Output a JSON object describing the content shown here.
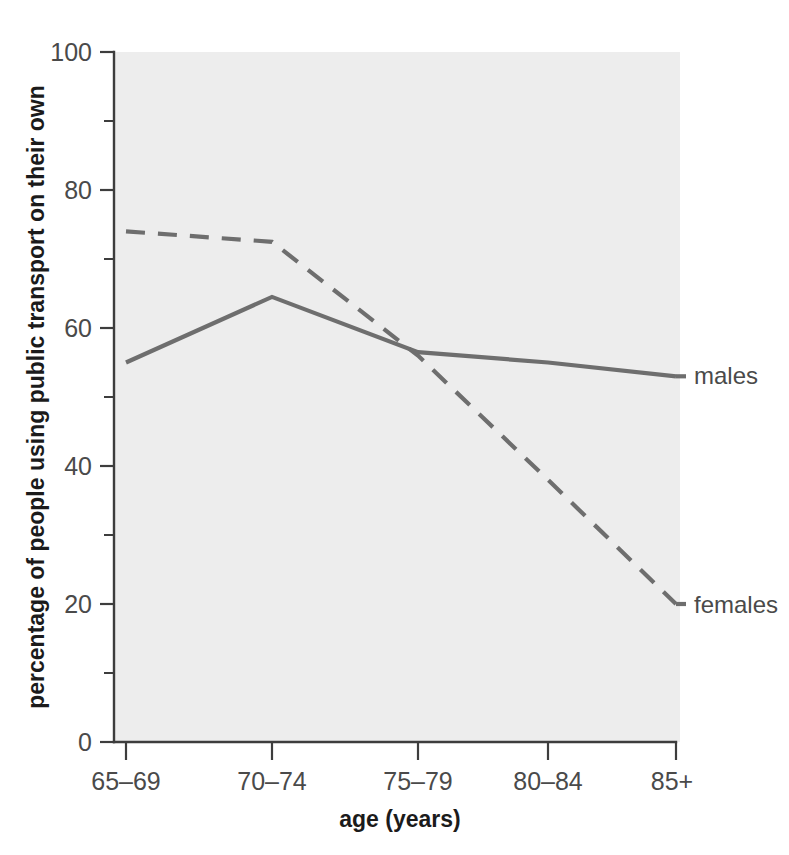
{
  "chart_data": {
    "type": "line",
    "title": "",
    "subtitle": "",
    "xlabel": "age (years)",
    "ylabel": "percentage of people using public transport on their own",
    "categories": [
      "65–69",
      "70–74",
      "75–79",
      "80–84",
      "85+"
    ],
    "series": [
      {
        "name": "males",
        "style": "solid",
        "color": "#6e6e6e",
        "values": [
          55,
          64.5,
          56.5,
          55,
          53
        ]
      },
      {
        "name": "females",
        "style": "dashed",
        "color": "#6e6e6e",
        "values": [
          74,
          72.5,
          56,
          38,
          20
        ]
      }
    ],
    "ylim": [
      0,
      100
    ],
    "y_ticks_major": [
      0,
      20,
      40,
      60,
      80,
      100
    ],
    "y_ticks_minor": [
      10,
      30,
      50,
      70,
      90
    ],
    "y_tick_labels": [
      "0",
      "20",
      "40",
      "60",
      "80",
      "100"
    ],
    "grid": false,
    "legend_position": "right-inline",
    "annotations": [
      {
        "text": "males",
        "series": "males",
        "value": 53,
        "category": "85+"
      },
      {
        "text": "females",
        "series": "females",
        "value": 20,
        "category": "85+"
      }
    ]
  },
  "axes": {
    "y_label": "percentage of people using public transport on their own",
    "x_label": "age (years)",
    "y_tick_labels": [
      "100",
      "80",
      "60",
      "40",
      "20",
      "0"
    ],
    "x_tick_labels": [
      "65–69",
      "70–74",
      "75–79",
      "80–84",
      "85+"
    ]
  },
  "legend": {
    "males_label": "males",
    "females_label": "females"
  },
  "colors": {
    "plot_background": "#ededed",
    "line": "#6e6e6e",
    "axis": "#3d3d3d",
    "text": "#3a3a3a",
    "page_background": "#ffffff"
  }
}
